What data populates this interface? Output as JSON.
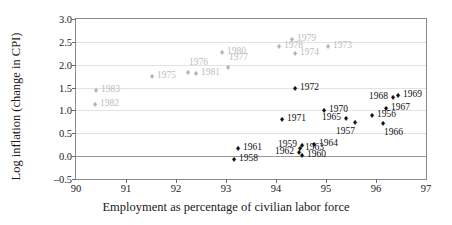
{
  "chart_data": {
    "type": "scatter",
    "title": "",
    "xlabel": "Employment as percentage of civilian labor force",
    "ylabel": "Log inflation (change in CPI)",
    "xlim": [
      90,
      97
    ],
    "ylim": [
      -0.5,
      3.0
    ],
    "xticks": [
      "90",
      "91",
      "92",
      "93",
      "94",
      "95",
      "96",
      "97"
    ],
    "yticks": [
      "-0.5",
      "0.0",
      "0.5",
      "1.0",
      "1.5",
      "2.0",
      "2.5",
      "3.0"
    ],
    "grid": true,
    "legend": "none",
    "series": [
      {
        "name": "1956-1972",
        "color": "#111111",
        "points": [
          {
            "label": "1958",
            "x": 93.16,
            "y": -0.06,
            "pos": "right"
          },
          {
            "label": "1961",
            "x": 93.24,
            "y": 0.18,
            "pos": "right"
          },
          {
            "label": "1962",
            "x": 94.46,
            "y": 0.1,
            "pos": "left"
          },
          {
            "label": "1963",
            "x": 94.48,
            "y": 0.17,
            "pos": "right"
          },
          {
            "label": "1959",
            "x": 94.52,
            "y": 0.24,
            "pos": "left"
          },
          {
            "label": "1960",
            "x": 94.52,
            "y": 0.02,
            "pos": "right"
          },
          {
            "label": "1964",
            "x": 94.76,
            "y": 0.26,
            "pos": "right"
          },
          {
            "label": "1957",
            "x": 95.58,
            "y": 0.75,
            "pos": "below-left"
          },
          {
            "label": "1965",
            "x": 95.4,
            "y": 0.83,
            "pos": "left"
          },
          {
            "label": "1966",
            "x": 96.14,
            "y": 0.72,
            "pos": "below"
          },
          {
            "label": "1956",
            "x": 95.92,
            "y": 0.9,
            "pos": "right"
          },
          {
            "label": "1971",
            "x": 94.12,
            "y": 0.82,
            "pos": "right"
          },
          {
            "label": "1970",
            "x": 94.96,
            "y": 1.0,
            "pos": "right"
          },
          {
            "label": "1967",
            "x": 96.2,
            "y": 1.05,
            "pos": "right"
          },
          {
            "label": "1968",
            "x": 96.34,
            "y": 1.3,
            "pos": "left"
          },
          {
            "label": "1969",
            "x": 96.44,
            "y": 1.33,
            "pos": "right"
          },
          {
            "label": "1972",
            "x": 94.38,
            "y": 1.49,
            "pos": "right"
          }
        ]
      },
      {
        "name": "1973-1983",
        "color": "#b4b4b4",
        "points": [
          {
            "label": "1982",
            "x": 90.38,
            "y": 1.13,
            "pos": "right"
          },
          {
            "label": "1983",
            "x": 90.4,
            "y": 1.44,
            "pos": "right"
          },
          {
            "label": "1975",
            "x": 91.52,
            "y": 1.75,
            "pos": "right"
          },
          {
            "label": "1976",
            "x": 92.24,
            "y": 1.83,
            "pos": "above"
          },
          {
            "label": "1981",
            "x": 92.4,
            "y": 1.82,
            "pos": "right"
          },
          {
            "label": "1977",
            "x": 93.04,
            "y": 1.95,
            "pos": "above"
          },
          {
            "label": "1980",
            "x": 92.92,
            "y": 2.28,
            "pos": "right"
          },
          {
            "label": "1978",
            "x": 94.06,
            "y": 2.41,
            "pos": "right"
          },
          {
            "label": "1979",
            "x": 94.32,
            "y": 2.57,
            "pos": "right"
          },
          {
            "label": "1974",
            "x": 94.38,
            "y": 2.25,
            "pos": "right"
          },
          {
            "label": "1973",
            "x": 95.04,
            "y": 2.41,
            "pos": "right"
          }
        ]
      }
    ]
  }
}
